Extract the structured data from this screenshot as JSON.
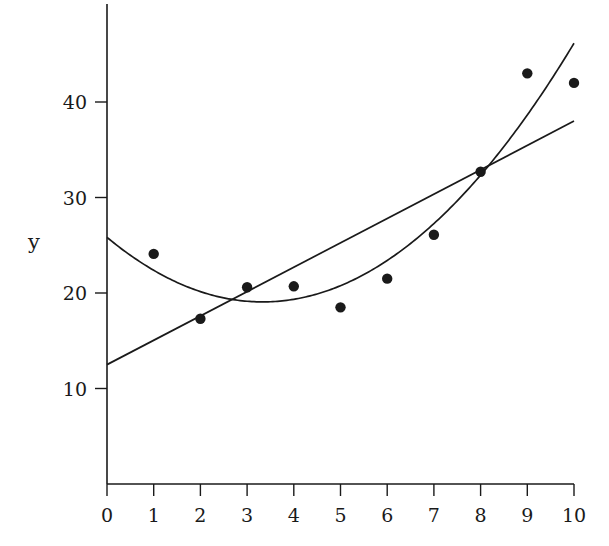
{
  "chart_data": {
    "type": "scatter",
    "title": "",
    "xlabel": "",
    "ylabel": "y",
    "xlim": [
      0,
      10
    ],
    "ylim": [
      0,
      50
    ],
    "x_ticks": [
      0,
      1,
      2,
      3,
      4,
      5,
      6,
      7,
      8,
      9,
      10
    ],
    "y_ticks": [
      10,
      20,
      30,
      40
    ],
    "grid": false,
    "legend": null,
    "series": [
      {
        "name": "data points",
        "type": "scatter",
        "x": [
          1,
          2,
          3,
          4,
          5,
          6,
          7,
          8,
          9,
          10
        ],
        "y": [
          24.1,
          17.3,
          20.6,
          20.7,
          18.5,
          21.5,
          26.1,
          32.7,
          43.0,
          42.0
        ]
      },
      {
        "name": "linear fit",
        "type": "line",
        "x": [
          0,
          10
        ],
        "y": [
          12.5,
          38.0
        ]
      },
      {
        "name": "quadratic fit",
        "type": "line",
        "x": [
          0,
          1,
          2,
          3,
          4,
          5,
          6,
          7,
          8,
          9,
          10
        ],
        "y": [
          26.1,
          22.4,
          20.0,
          18.9,
          19.1,
          20.6,
          23.4,
          27.5,
          32.9,
          39.0,
          45.5
        ]
      }
    ]
  },
  "style": {
    "ink": "#1a1a1a",
    "background": "#ffffff"
  }
}
